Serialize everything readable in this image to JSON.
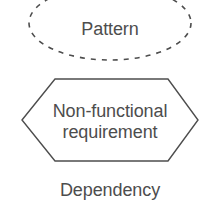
{
  "diagram": {
    "background_color": "#ffffff",
    "stroke_color": "#4d4d4d",
    "text_color": "#4d4d4d",
    "elements": [
      {
        "id": "pattern",
        "shape": "dashed-ellipse",
        "label": "Pattern",
        "note": "ellipse outline is dashed and clipped at the top image edge"
      },
      {
        "id": "non-functional-requirement",
        "shape": "hexagon",
        "label_line1": "Non-functional",
        "label_line2": "requirement",
        "note": "solid thin outline elongated hexagon"
      },
      {
        "id": "dependency",
        "shape": "text-only",
        "label": "Dependency",
        "note": "plain caption with no surrounding shape"
      }
    ]
  }
}
